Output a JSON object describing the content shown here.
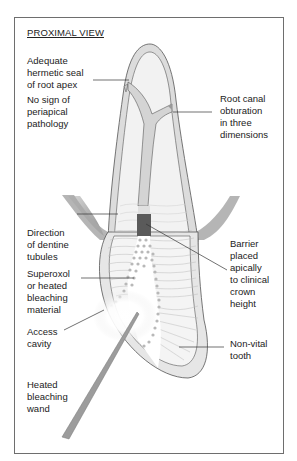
{
  "title": "PROXIMAL VIEW",
  "labels": {
    "hermetic_seal": "Adequate\nhermetic seal\nof root apex",
    "no_pathology": "No sign of\nperiapical\npathology",
    "root_canal": "Root canal\nobturation\nin three\ndimensions",
    "dentine_tubules": "Direction\nof dentine\ntubules",
    "bleaching_material": "Superoxol\nor heated\nbleaching\nmaterial",
    "access_cavity": "Access\ncavity",
    "heated_wand": "Heated\nbleaching\nwand",
    "barrier": "Barrier\nplaced\napically\nto clinical\ncrown\nheight",
    "non_vital": "Non-vital\ntooth"
  },
  "colors": {
    "frame": "#6e6e6e",
    "outline": "#555555",
    "enamel_fill": "#dcdcdc",
    "dentine_fill": "#f2f2f2",
    "canal_fill": "#d6d6d6",
    "barrier": "#5a5a5a",
    "gum": "#9a9a9a",
    "dots": "#b8b8b8",
    "wand": "#9c9c9c"
  }
}
